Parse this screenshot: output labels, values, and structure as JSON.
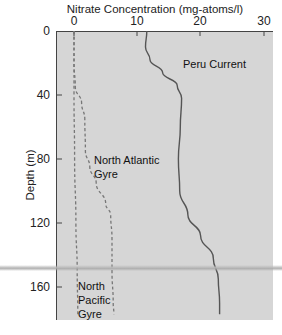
{
  "chart_data": {
    "type": "line",
    "title": "Nitrate Concentration (mg-atoms/l)",
    "xlabel": "Nitrate Concentration (mg-atoms/l)",
    "ylabel": "Depth (m)",
    "x_axis_position": "top",
    "y_axis_inverted": true,
    "xlim": [
      -3,
      31
    ],
    "ylim": [
      0,
      180
    ],
    "xticks": [
      0,
      10,
      20,
      30
    ],
    "yticks": [
      0,
      40,
      80,
      120,
      160
    ],
    "grid": false,
    "legend": "inline labels",
    "series": [
      {
        "name": "Peru Current",
        "style": "solid",
        "points": [
          [
            11.5,
            0
          ],
          [
            11.3,
            10
          ],
          [
            12,
            18
          ],
          [
            14,
            26
          ],
          [
            16.3,
            34
          ],
          [
            17,
            42
          ],
          [
            16.8,
            60
          ],
          [
            16.5,
            80
          ],
          [
            16.7,
            100
          ],
          [
            18,
            115
          ],
          [
            20,
            128
          ],
          [
            22,
            142
          ],
          [
            22.8,
            155
          ],
          [
            23,
            170
          ],
          [
            23,
            177
          ]
        ]
      },
      {
        "name": "North Atlantic Gyre",
        "style": "dashed",
        "points": [
          [
            0,
            0
          ],
          [
            0,
            20
          ],
          [
            0.2,
            35
          ],
          [
            1.2,
            45
          ],
          [
            1.7,
            55
          ],
          [
            1.8,
            75
          ],
          [
            2.5,
            85
          ],
          [
            3.5,
            95
          ],
          [
            5,
            108
          ],
          [
            5.8,
            115
          ],
          [
            6,
            130
          ],
          [
            6,
            150
          ],
          [
            6.2,
            170
          ],
          [
            6.3,
            177
          ]
        ]
      },
      {
        "name": "North Pacific Gyre",
        "style": "dashed",
        "points": [
          [
            0,
            0
          ],
          [
            0,
            40
          ],
          [
            0.1,
            80
          ],
          [
            0.3,
            120
          ],
          [
            0.5,
            150
          ],
          [
            0.6,
            177
          ]
        ]
      }
    ],
    "annotations": [
      "Peru Current",
      "North Atlantic Gyre",
      "North Pacific Gyre"
    ]
  },
  "labels": {
    "title": "Nitrate Concentration (mg-atoms/l)",
    "ylabel": "Depth (m)",
    "xticks": [
      "0",
      "10",
      "20",
      "30"
    ],
    "yticks": [
      "0",
      "40",
      "80",
      "120",
      "160"
    ],
    "peru": "Peru Current",
    "atlantic_1": "North Atlantic",
    "atlantic_2": "Gyre",
    "pacific_1": "North",
    "pacific_2": "Pacific",
    "pacific_3": "Gyre"
  },
  "colors": {
    "plot_bg": "#d6d6d6",
    "solid_line": "#555555",
    "dashed_line": "#777777"
  }
}
